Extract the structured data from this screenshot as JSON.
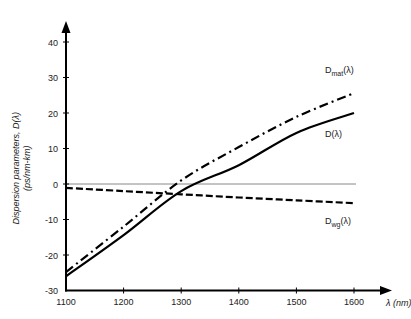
{
  "chart_data": {
    "type": "line",
    "title": "",
    "xlabel": "λ (nm)",
    "ylabel": "Dispersion parameters, D(λ)",
    "ylabel_units": "(ps/nm-km)",
    "xlim": [
      1100,
      1600
    ],
    "ylim": [
      -30,
      40
    ],
    "xticks": [
      1100,
      1200,
      1300,
      1400,
      1500,
      1600
    ],
    "yticks": [
      -30,
      -20,
      -10,
      0,
      10,
      20,
      30,
      40
    ],
    "grid": false,
    "legend": "inline labels at right end of curves",
    "x": [
      1100,
      1200,
      1300,
      1400,
      1500,
      1600
    ],
    "series": [
      {
        "name": "D_mat(λ)",
        "label_main": "D",
        "label_sub": "mat",
        "label_suffix": "(λ)",
        "style": "dash-dot",
        "values": [
          -24.8,
          -12.0,
          1.0,
          10.4,
          18.9,
          25.6
        ]
      },
      {
        "name": "D(λ)",
        "label_main": "D(λ)",
        "label_sub": "",
        "label_suffix": "",
        "style": "solid",
        "values": [
          -26.0,
          -14.4,
          -2.0,
          5.3,
          14.4,
          20.0
        ]
      },
      {
        "name": "D_wg(λ)",
        "label_main": "D",
        "label_sub": "wg",
        "label_suffix": "(λ)",
        "style": "dashed",
        "values": [
          -1.1,
          -2.0,
          -2.9,
          -3.8,
          -4.6,
          -5.4
        ]
      }
    ],
    "reference_lines": [
      {
        "y": 0,
        "style": "thin solid gray"
      }
    ]
  }
}
